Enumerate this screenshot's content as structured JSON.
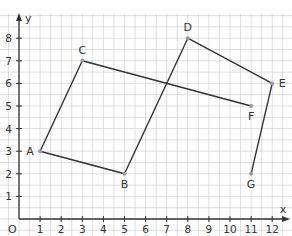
{
  "diagram": {
    "type": "coordinate-grid-figure",
    "axes": {
      "x_label": "x",
      "y_label": "y",
      "origin_label": "O",
      "x_ticks": [
        "1",
        "2",
        "3",
        "4",
        "5",
        "6",
        "7",
        "8",
        "9",
        "10",
        "11",
        "12"
      ],
      "y_ticks": [
        "1",
        "2",
        "3",
        "4",
        "5",
        "6",
        "7",
        "8"
      ],
      "x_range": [
        0,
        12.6
      ],
      "y_range": [
        0,
        8.9
      ]
    },
    "points": [
      {
        "label": "A",
        "x": 1,
        "y": 3
      },
      {
        "label": "B",
        "x": 5,
        "y": 2
      },
      {
        "label": "C",
        "x": 3,
        "y": 7
      },
      {
        "label": "D",
        "x": 8,
        "y": 8
      },
      {
        "label": "E",
        "x": 12,
        "y": 6
      },
      {
        "label": "F",
        "x": 11,
        "y": 5
      },
      {
        "label": "G",
        "x": 11,
        "y": 2
      }
    ],
    "segments": [
      [
        "A",
        "B"
      ],
      [
        "A",
        "C"
      ],
      [
        "C",
        "F"
      ],
      [
        "B",
        "D"
      ],
      [
        "D",
        "E"
      ],
      [
        "E",
        "G"
      ]
    ],
    "colors": {
      "grid": "#c8c8c8",
      "axis": "#333333",
      "line": "#333333",
      "point": "#999999"
    }
  }
}
